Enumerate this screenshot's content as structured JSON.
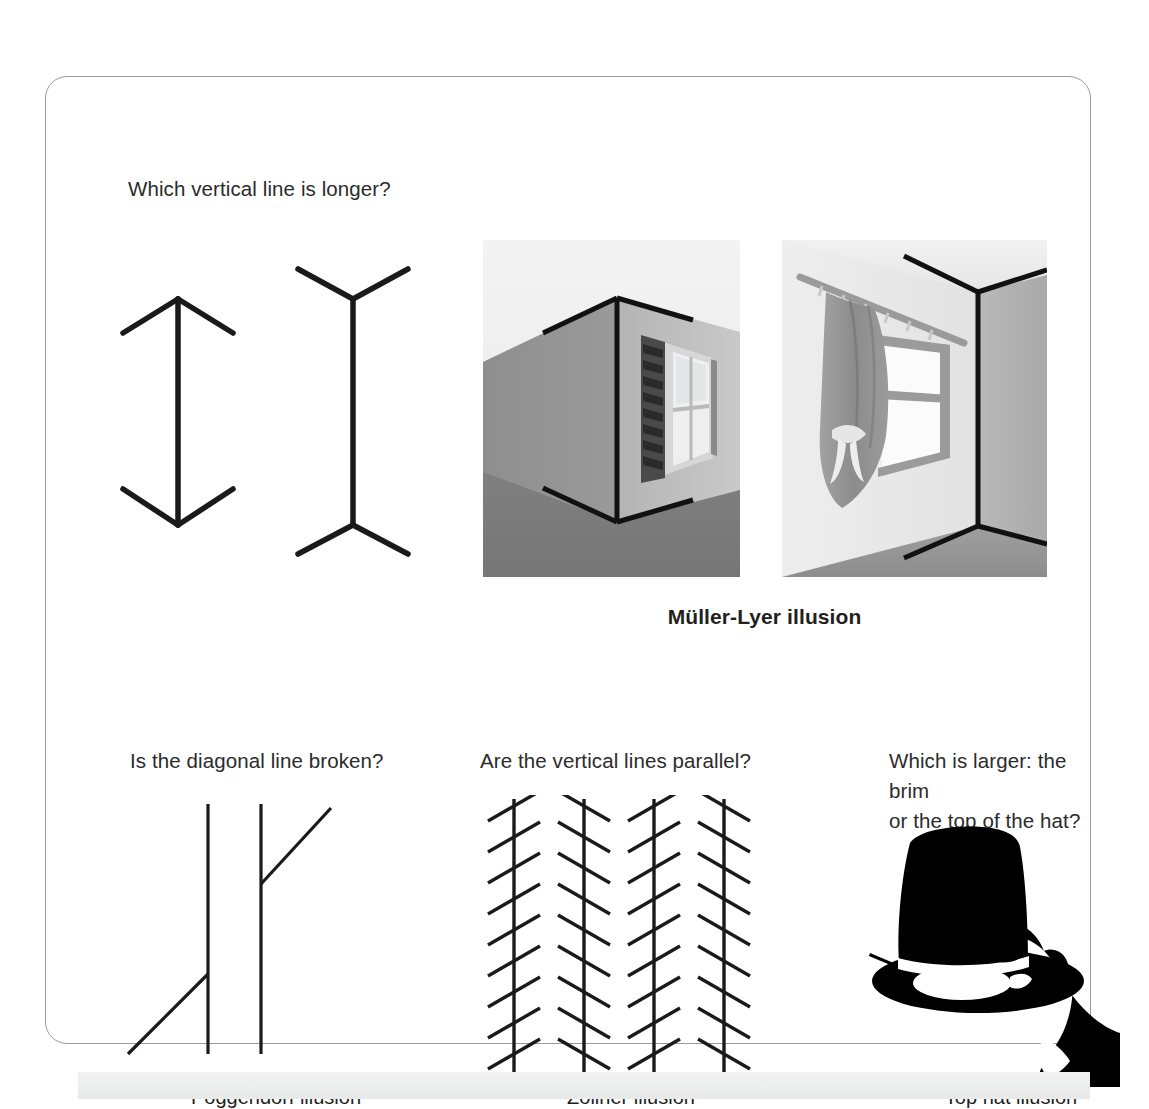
{
  "card": {
    "questions": {
      "muller_lyer": "Which vertical line is longer?",
      "poggendorf": "Is the diagonal line broken?",
      "zollner": "Are the vertical lines parallel?",
      "tophat": "Which is larger: the brim\nor the top of the hat?"
    },
    "captions": {
      "muller_lyer": "Müller-Lyer illusion",
      "poggendorf": "Poggendorf illusion",
      "zollner": "Zöllner illusion",
      "tophat": "Top hat illusion"
    },
    "figures": {
      "muller_lyer_arrows": {
        "name": "muller-lyer-arrow-pair",
        "left_label": "arrows-pointing-in",
        "right_label": "arrows-pointing-out"
      },
      "photo_corner": {
        "name": "building-outside-corner-photo",
        "description": "Outside corner of a building with a window, black fin lines forming inward arrowheads"
      },
      "photo_room": {
        "name": "room-inside-corner-photo",
        "description": "Inside corner of a room with a curtained window, black fin lines forming outward arrowheads"
      },
      "poggendorf": {
        "name": "poggendorf-figure",
        "description": "Two vertical lines interrupted by a diagonal line"
      },
      "zollner": {
        "name": "zollner-figure",
        "lines": 4,
        "hatches_per_line": 9,
        "description": "Four parallel vertical lines crossed by short tilted hatch marks"
      },
      "tophat": {
        "name": "top-hat-silhouette",
        "description": "Black silhouette of a hand holding a top hat"
      }
    }
  },
  "colors": {
    "ink": "#231f20",
    "card_border": "#9a9a9a",
    "page_bg": "#ffffff",
    "band": "#ececec"
  },
  "bottom_band": {
    "ghost_text": ""
  }
}
